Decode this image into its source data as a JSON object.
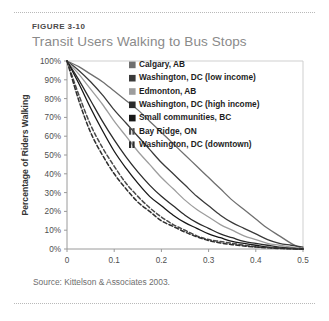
{
  "figure": {
    "number": "FIGURE 3-10",
    "title": "Transit Users Walking to Bus Stops",
    "source": "Source: Kittelson & Associates 2003."
  },
  "chart_data": {
    "type": "line",
    "title": "Transit Users Walking to Bus Stops",
    "xlabel": "Walking Distance to Bus (mi)",
    "ylabel": "Percentage of Riders Walking",
    "xlim": [
      0,
      0.5
    ],
    "ylim": [
      0,
      100
    ],
    "grid": false,
    "legend_position": "upper-right-inside",
    "xticks": [
      0,
      0.1,
      0.2,
      0.3,
      0.4,
      0.5
    ],
    "xtick_labels": [
      "0",
      "0.1",
      "0.2",
      "0.3",
      "0.4",
      "0.5"
    ],
    "yticks": [
      0,
      10,
      20,
      30,
      40,
      50,
      60,
      70,
      80,
      90,
      100
    ],
    "ytick_labels": [
      "0%",
      "10%",
      "20%",
      "30%",
      "40%",
      "50%",
      "60%",
      "70%",
      "80%",
      "90%",
      "100%"
    ],
    "x": [
      0,
      0.025,
      0.05,
      0.075,
      0.1,
      0.125,
      0.15,
      0.175,
      0.2,
      0.225,
      0.25,
      0.275,
      0.3,
      0.325,
      0.35,
      0.375,
      0.4,
      0.425,
      0.45,
      0.475,
      0.5
    ],
    "series": [
      {
        "name": "Calgary, AB",
        "color": "#6f6f6f",
        "dash": "none",
        "width": 1.3,
        "swatch": "solid",
        "values": [
          100,
          97,
          93,
          89,
          84,
          79,
          74,
          68,
          62,
          56,
          50,
          44,
          38,
          32,
          26,
          21,
          16,
          11,
          7,
          3,
          0
        ]
      },
      {
        "name": "Washington, DC (low income)",
        "color": "#3a3a3a",
        "dash": "none",
        "width": 1.3,
        "swatch": "solid",
        "values": [
          100,
          95,
          89,
          82,
          74,
          67,
          60,
          53,
          46,
          40,
          34,
          28,
          23,
          18,
          14,
          11,
          8,
          5,
          3,
          2,
          1
        ]
      },
      {
        "name": "Edmonton, AB",
        "color": "#9d9d9d",
        "dash": "none",
        "width": 1.3,
        "swatch": "solid",
        "values": [
          100,
          93,
          85,
          77,
          68,
          60,
          52,
          45,
          38,
          32,
          26,
          21,
          17,
          13,
          10,
          7,
          5,
          3,
          2,
          1,
          0
        ]
      },
      {
        "name": "Washington, DC (high income)",
        "color": "#2b2b2b",
        "dash": "none",
        "width": 1.3,
        "swatch": "solid",
        "values": [
          100,
          90,
          79,
          68,
          58,
          49,
          41,
          34,
          28,
          23,
          18,
          14,
          11,
          8,
          6,
          4,
          3,
          2,
          1,
          0.5,
          0
        ]
      },
      {
        "name": "Small communities, BC",
        "color": "#171717",
        "dash": "none",
        "width": 1.3,
        "swatch": "solid",
        "values": [
          100,
          88,
          75,
          63,
          52,
          43,
          35,
          28,
          23,
          18,
          14,
          11,
          8,
          6,
          4,
          3,
          2,
          1,
          0.5,
          0.2,
          0
        ]
      },
      {
        "name": "Bay Ridge, ON",
        "color": "#4a4a4a",
        "dash": "4,2.4",
        "width": 1.5,
        "swatch": "dashed",
        "values": [
          100,
          82,
          66,
          54,
          44,
          35,
          28,
          22,
          17,
          13,
          10,
          7,
          5,
          4,
          3,
          2,
          1.2,
          0.8,
          0.4,
          0.2,
          0
        ]
      },
      {
        "name": "Washington, DC (downtown)",
        "color": "#2e2e2e",
        "dash": "4,2.4",
        "width": 1.5,
        "swatch": "dashed",
        "values": [
          100,
          79,
          62,
          50,
          40,
          32,
          25,
          20,
          15,
          12,
          9,
          6.5,
          4.5,
          3.2,
          2.3,
          1.6,
          1,
          0.6,
          0.3,
          0.1,
          0
        ]
      }
    ]
  }
}
